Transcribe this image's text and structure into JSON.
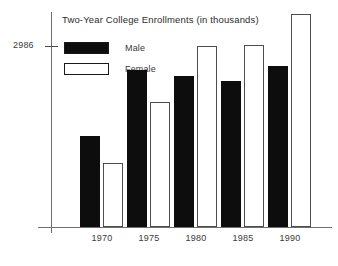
{
  "chart_data": {
    "type": "bar",
    "title": "Two-Year College Enrollments (in thousands)",
    "xlabel": "",
    "ylabel": "",
    "categories": [
      "1970",
      "1975",
      "1980",
      "1985",
      "1990"
    ],
    "series": [
      {
        "name": "Male",
        "color": "#0d0d0d",
        "values": [
          1270,
          2180,
          2100,
          2030,
          2230
        ]
      },
      {
        "name": "Female",
        "color": "#ffffff",
        "values": [
          890,
          1730,
          2510,
          2525,
          2955
        ]
      }
    ],
    "ylim": [
      0,
      2986
    ],
    "y_ticks": [
      "2986"
    ],
    "grid": false,
    "legend_position": "top-left"
  },
  "axes": {
    "y_tick_label": "2986"
  },
  "legend": {
    "items": [
      {
        "label": "Male"
      },
      {
        "label": "Female"
      }
    ]
  }
}
